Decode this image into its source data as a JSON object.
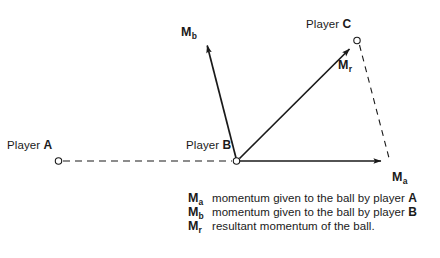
{
  "diagram": {
    "background_color": "#ffffff",
    "stroke_color": "#1a1a1a",
    "width": 440,
    "height": 258
  },
  "players": [
    {
      "key": "a",
      "label_prefix": "Player",
      "id": "A",
      "x": 58,
      "y": 161
    },
    {
      "key": "b",
      "label_prefix": "Player",
      "id": "B",
      "x": 237,
      "y": 161
    },
    {
      "key": "c",
      "label_prefix": "Player",
      "id": "C",
      "x": 357,
      "y": 40
    }
  ],
  "vectors": [
    {
      "key": "ma",
      "symbol": "M",
      "subscript": "a",
      "style": "solid",
      "x1": 237,
      "y1": 161,
      "x2": 388,
      "y2": 161,
      "label_x": 392,
      "label_y": 171
    },
    {
      "key": "mb",
      "symbol": "M",
      "subscript": "b",
      "style": "solid",
      "x1": 237,
      "y1": 161,
      "x2": 206,
      "y2": 40,
      "label_x": 181,
      "label_y": 26
    },
    {
      "key": "mr",
      "symbol": "M",
      "subscript": "r",
      "style": "solid",
      "x1": 237,
      "y1": 161,
      "x2": 354,
      "y2": 44,
      "label_x": 338,
      "label_y": 59
    }
  ],
  "construction_lines": [
    {
      "key": "a-to-b",
      "style": "dashed",
      "x1": 63,
      "y1": 161,
      "x2": 233,
      "y2": 161
    },
    {
      "key": "c-to-ma-tip",
      "style": "dashed",
      "x1": 359,
      "y1": 45,
      "x2": 389,
      "y2": 158
    }
  ],
  "legend": {
    "rows": [
      {
        "symbol": "M",
        "subscript": "a",
        "text_before": "momentum given to the ball by player ",
        "bold_token": "A",
        "text_after": ""
      },
      {
        "symbol": "M",
        "subscript": "b",
        "text_before": "momentum given to the ball by player ",
        "bold_token": "B",
        "text_after": ""
      },
      {
        "symbol": "M",
        "subscript": "r",
        "text_before": "resultant momentum of the ball.",
        "bold_token": "",
        "text_after": ""
      }
    ]
  }
}
